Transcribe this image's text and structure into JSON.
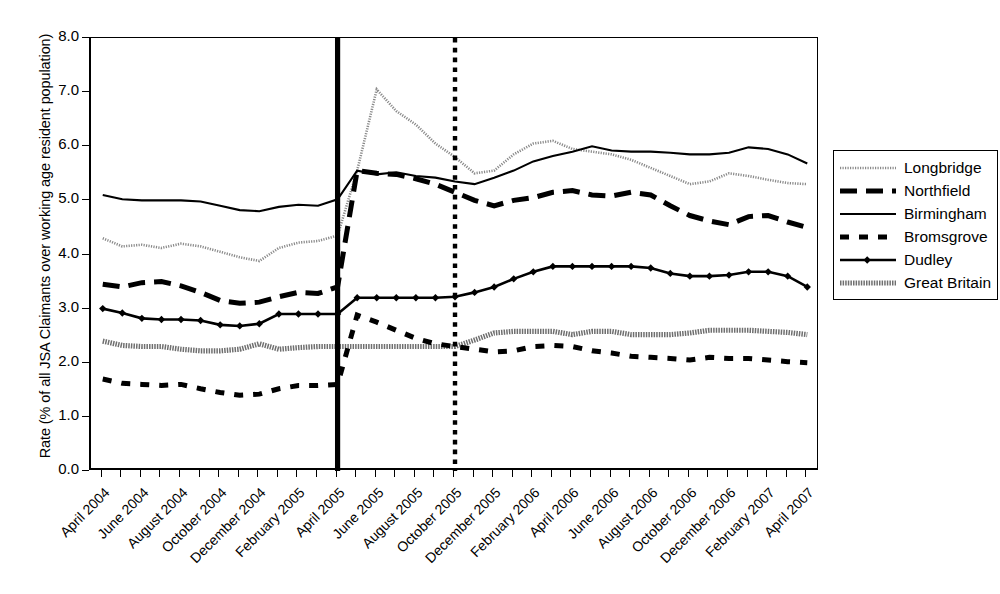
{
  "chart_data": {
    "type": "line",
    "title": "",
    "xlabel": "",
    "ylabel": "Rate (% of all JSA Claimants over working age resident population)",
    "ylim": [
      0.0,
      8.0
    ],
    "ytick_labels": [
      "0.0",
      "1.0",
      "2.0",
      "3.0",
      "4.0",
      "5.0",
      "6.0",
      "7.0",
      "8.0"
    ],
    "ytick_values": [
      0,
      1,
      2,
      3,
      4,
      5,
      6,
      7,
      8
    ],
    "grid": false,
    "legend_position": "right-outside",
    "x": [
      "April 2004",
      "May 2004",
      "June 2004",
      "July 2004",
      "August 2004",
      "September 2004",
      "October 2004",
      "November 2004",
      "December 2004",
      "January 2005",
      "February 2005",
      "March 2005",
      "April 2005",
      "May 2005",
      "June 2005",
      "July 2005",
      "August 2005",
      "September 2005",
      "October 2005",
      "November 2005",
      "December 2005",
      "January 2006",
      "February 2006",
      "March 2006",
      "April 2006",
      "May 2006",
      "June 2006",
      "July 2006",
      "August 2006",
      "September 2006",
      "October 2006",
      "November 2006",
      "December 2006",
      "January 2007",
      "February 2007",
      "March 2007",
      "April 2007"
    ],
    "xtick_labels": [
      "April 2004",
      "June 2004",
      "August 2004",
      "October 2004",
      "December 2004",
      "February 2005",
      "April 2005",
      "June 2005",
      "August 2005",
      "October 2005",
      "December 2005",
      "February 2006",
      "April 2006",
      "June 2006",
      "August 2006",
      "October 2006",
      "December 2006",
      "February 2007",
      "April 2007"
    ],
    "xtick_label_indices": [
      0,
      2,
      4,
      6,
      8,
      10,
      12,
      14,
      16,
      18,
      20,
      22,
      24,
      26,
      28,
      30,
      32,
      34,
      36
    ],
    "annotations": [
      {
        "name": "solid-vertical-line",
        "x_index": 12,
        "style": "solid",
        "label": ""
      },
      {
        "name": "dotted-vertical-line",
        "x_index": 18,
        "style": "dotted",
        "label": ""
      }
    ],
    "series": [
      {
        "name": "Longbridge",
        "style": "fine-dotted",
        "color": "#8a8a8a",
        "values": [
          4.3,
          4.15,
          4.18,
          4.12,
          4.2,
          4.15,
          4.05,
          3.95,
          3.88,
          4.12,
          4.22,
          4.25,
          4.35,
          5.55,
          7.05,
          6.65,
          6.4,
          6.05,
          5.8,
          5.5,
          5.55,
          5.85,
          6.05,
          6.1,
          5.95,
          5.9,
          5.85,
          5.75,
          5.6,
          5.45,
          5.3,
          5.35,
          5.5,
          5.45,
          5.38,
          5.32,
          5.3
        ]
      },
      {
        "name": "Northfield",
        "style": "thick-dashed",
        "color": "#000000",
        "values": [
          3.45,
          3.4,
          3.48,
          3.5,
          3.42,
          3.3,
          3.15,
          3.1,
          3.12,
          3.22,
          3.3,
          3.28,
          3.4,
          5.55,
          5.5,
          5.48,
          5.4,
          5.3,
          5.15,
          5.0,
          4.9,
          5.0,
          5.05,
          5.15,
          5.18,
          5.1,
          5.08,
          5.15,
          5.1,
          4.9,
          4.72,
          4.62,
          4.55,
          4.7,
          4.72,
          4.6,
          4.5
        ]
      },
      {
        "name": "Birmingham",
        "style": "thin-solid",
        "color": "#000000",
        "values": [
          5.1,
          5.02,
          5.0,
          5.0,
          5.0,
          4.98,
          4.9,
          4.82,
          4.8,
          4.88,
          4.92,
          4.9,
          5.02,
          5.55,
          5.48,
          5.52,
          5.45,
          5.42,
          5.35,
          5.3,
          5.42,
          5.55,
          5.72,
          5.82,
          5.9,
          6.0,
          5.92,
          5.9,
          5.9,
          5.88,
          5.85,
          5.85,
          5.88,
          5.98,
          5.95,
          5.85,
          5.68
        ]
      },
      {
        "name": "Bromsgrove",
        "style": "thick-dashed-short",
        "color": "#000000",
        "values": [
          1.7,
          1.62,
          1.6,
          1.58,
          1.6,
          1.52,
          1.45,
          1.4,
          1.42,
          1.52,
          1.58,
          1.58,
          1.6,
          2.88,
          2.75,
          2.6,
          2.45,
          2.35,
          2.3,
          2.25,
          2.2,
          2.22,
          2.3,
          2.32,
          2.3,
          2.22,
          2.18,
          2.12,
          2.1,
          2.08,
          2.05,
          2.1,
          2.08,
          2.08,
          2.05,
          2.02,
          2.0
        ]
      },
      {
        "name": "Dudley",
        "style": "line-with-diamond-markers",
        "color": "#000000",
        "values": [
          3.0,
          2.92,
          2.82,
          2.8,
          2.8,
          2.78,
          2.7,
          2.68,
          2.72,
          2.9,
          2.9,
          2.9,
          2.9,
          3.2,
          3.2,
          3.2,
          3.2,
          3.2,
          3.22,
          3.3,
          3.4,
          3.55,
          3.68,
          3.78,
          3.78,
          3.78,
          3.78,
          3.78,
          3.75,
          3.65,
          3.6,
          3.6,
          3.62,
          3.68,
          3.68,
          3.6,
          3.4
        ]
      },
      {
        "name": "Great Britain",
        "style": "hatched-thick",
        "color": "#6f6f6f",
        "values": [
          2.4,
          2.32,
          2.3,
          2.3,
          2.25,
          2.22,
          2.22,
          2.25,
          2.35,
          2.25,
          2.28,
          2.3,
          2.3,
          2.3,
          2.3,
          2.3,
          2.3,
          2.3,
          2.3,
          2.42,
          2.55,
          2.58,
          2.58,
          2.58,
          2.52,
          2.58,
          2.58,
          2.52,
          2.52,
          2.52,
          2.55,
          2.6,
          2.6,
          2.6,
          2.58,
          2.56,
          2.52
        ]
      }
    ]
  },
  "legend": {
    "items": [
      {
        "label": "Longbridge",
        "key": "fine-dotted"
      },
      {
        "label": "Northfield",
        "key": "thick-dashed"
      },
      {
        "label": "Birmingham",
        "key": "thin-solid"
      },
      {
        "label": "Bromsgrove",
        "key": "thick-dashed-short"
      },
      {
        "label": "Dudley",
        "key": "line-with-diamond-markers"
      },
      {
        "label": "Great Britain",
        "key": "hatched-thick"
      }
    ]
  }
}
